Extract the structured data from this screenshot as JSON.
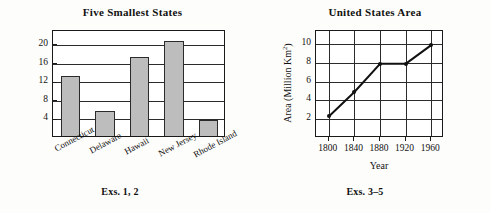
{
  "chart_data": [
    {
      "type": "bar",
      "title": "Five Smallest States",
      "xlabel": "",
      "ylabel": "Area (Thousands Km",
      "ylabel_sup": "2",
      "ylabel_close": ")",
      "caption": "Exs. 1, 2",
      "categories": [
        "Connecticut",
        "Delaware",
        "Hawaii",
        "New Jersey",
        "Rhode Island"
      ],
      "values": [
        12.9,
        5.3,
        17.0,
        20.5,
        3.5
      ],
      "yticks": [
        4,
        8,
        12,
        16,
        20
      ],
      "ylim": [
        0,
        23
      ],
      "grid": "horizontal",
      "legend": "none",
      "bar_fill": "#bdbdbd",
      "bar_outline": "#2b2b2b"
    },
    {
      "type": "line",
      "title": "United States Area",
      "xlabel": "Year",
      "ylabel": "Area (Million Km",
      "ylabel_sup": "2",
      "ylabel_close": ")",
      "caption": "Exs. 3–5",
      "x": [
        1800,
        1840,
        1880,
        1920,
        1960
      ],
      "values": [
        2.3,
        4.9,
        7.9,
        7.9,
        9.9
      ],
      "xticks": [
        1800,
        1840,
        1880,
        1920,
        1960
      ],
      "yticks": [
        2,
        4,
        6,
        8,
        10
      ],
      "ylim": [
        0,
        11.4
      ],
      "xlim": [
        1780,
        1980
      ],
      "grid": "both",
      "legend": "none",
      "line_color": "#111111",
      "marker": "filled-circle"
    }
  ]
}
